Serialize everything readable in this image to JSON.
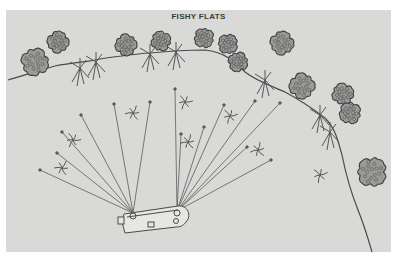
{
  "illustration": {
    "title": "FISHY FLATS",
    "colors": {
      "background": "#d9d9d7",
      "ink": "#4a4a4a",
      "page": "#ffffff"
    },
    "boat": {
      "label": "boat",
      "cast_origins": [
        [
          133,
          213
        ],
        [
          177,
          211
        ]
      ]
    },
    "cast_lines": {
      "from_stern": [
        [
          40,
          170
        ],
        [
          57,
          153
        ],
        [
          62,
          132
        ],
        [
          81,
          115
        ],
        [
          114,
          104
        ],
        [
          150,
          102
        ]
      ],
      "from_bow": [
        [
          175,
          89
        ],
        [
          181,
          134
        ],
        [
          204,
          127
        ],
        [
          224,
          105
        ],
        [
          255,
          101
        ],
        [
          280,
          103
        ],
        [
          247,
          147
        ],
        [
          271,
          160
        ]
      ]
    },
    "trees": [
      [
        35,
        62,
        14
      ],
      [
        58,
        42,
        11
      ],
      [
        126,
        45,
        11
      ],
      [
        161,
        41,
        10
      ],
      [
        204,
        38,
        10
      ],
      [
        228,
        44,
        10
      ],
      [
        238,
        62,
        10
      ],
      [
        282,
        43,
        12
      ],
      [
        302,
        86,
        13
      ],
      [
        343,
        94,
        11
      ],
      [
        350,
        113,
        11
      ],
      [
        372,
        172,
        15
      ]
    ],
    "weed_beds": [
      [
        62,
        168
      ],
      [
        73,
        140
      ],
      [
        133,
        113
      ],
      [
        185,
        102
      ],
      [
        188,
        142
      ],
      [
        230,
        116
      ],
      [
        258,
        150
      ],
      [
        320,
        175
      ]
    ]
  }
}
